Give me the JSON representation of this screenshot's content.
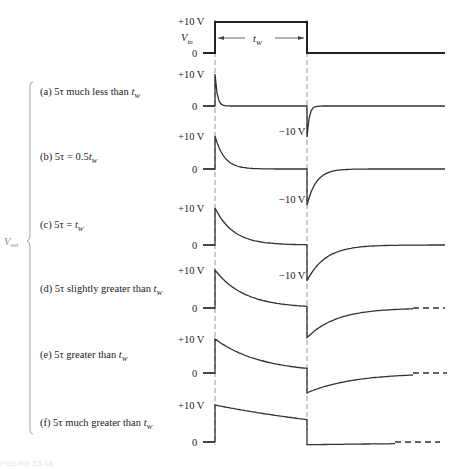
{
  "figure": {
    "caption": "FIGURE 13-18",
    "input": {
      "name": "V",
      "subscript": "in",
      "high_label": "+10 V",
      "low_label": "0",
      "width_label": "t",
      "width_subscript": "W",
      "amplitude_v": 10
    },
    "output_label": "V",
    "output_subscript": "out",
    "cases": [
      {
        "id": "a",
        "prefix": "(a) 5τ much less than ",
        "t": "t",
        "sub": "W",
        "high_label": "+10 V",
        "low_label": "0",
        "neg_label": "−10 V",
        "show_neg": true,
        "ratio": 0.12
      },
      {
        "id": "b",
        "prefix": "(b) 5τ  =  0.5",
        "t": "t",
        "sub": "W",
        "high_label": "+10 V",
        "low_label": "0",
        "neg_label": "−10 V",
        "show_neg": true,
        "ratio": 0.5
      },
      {
        "id": "c",
        "prefix": "(c) 5τ  =  ",
        "t": "t",
        "sub": "W",
        "high_label": "+10 V",
        "low_label": "0",
        "neg_label": "−10 V",
        "show_neg": true,
        "ratio": 1.0
      },
      {
        "id": "d",
        "prefix": "(d) 5τ slightly greater than ",
        "t": "t",
        "sub": "W",
        "high_label": "+10 V",
        "low_label": "0",
        "neg_label": "",
        "show_neg": false,
        "ratio": 1.6
      },
      {
        "id": "e",
        "prefix": "(e) 5τ greater than ",
        "t": "t",
        "sub": "W",
        "high_label": "+10 V",
        "low_label": "0",
        "neg_label": "",
        "show_neg": false,
        "ratio": 2.5
      },
      {
        "id": "f",
        "prefix": "(f) 5τ much greater than ",
        "t": "t",
        "sub": "W",
        "high_label": "+10 V",
        "low_label": "0",
        "neg_label": "",
        "show_neg": false,
        "ratio": 10
      }
    ]
  }
}
